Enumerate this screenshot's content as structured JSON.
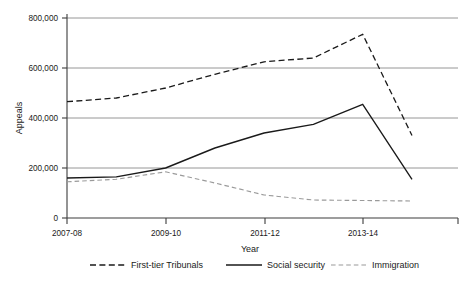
{
  "chart_data": {
    "type": "line",
    "title": "",
    "xlabel": "Year",
    "ylabel": "Appeals",
    "categories": [
      "2007-08",
      "2008-09",
      "2009-10",
      "2010-11",
      "2011-12",
      "2012-13",
      "2013-14",
      "2014-15"
    ],
    "xtick_labels": [
      "2007-08",
      "2009-10",
      "2011-12",
      "2013-14"
    ],
    "ytick_labels": [
      "0",
      "200,000",
      "400,000",
      "600,000",
      "800,000"
    ],
    "yticks": [
      0,
      200000,
      400000,
      600000,
      800000
    ],
    "ylim": [
      0,
      800000
    ],
    "grid": "horizontal",
    "legend_position": "bottom",
    "series": [
      {
        "name": "First-tier Tribunals",
        "style": "dashed",
        "color": "#1a1a1a",
        "values": [
          465000,
          480000,
          520000,
          575000,
          625000,
          640000,
          735000,
          330000
        ]
      },
      {
        "name": "Social security",
        "style": "solid",
        "color": "#1a1a1a",
        "values": [
          160000,
          165000,
          200000,
          280000,
          340000,
          375000,
          455000,
          155000
        ]
      },
      {
        "name": "Immigration",
        "style": "dashed-light",
        "color": "#9a9a9a",
        "values": [
          145000,
          155000,
          185000,
          140000,
          92000,
          72000,
          70000,
          68000
        ]
      }
    ]
  },
  "axis": {
    "y_title": "Appeals",
    "x_title": "Year",
    "y_labels": [
      "800,000",
      "600,000",
      "400,000",
      "200,000",
      "0"
    ],
    "x_labels": [
      "2007-08",
      "2009-10",
      "2011-12",
      "2013-14"
    ]
  },
  "legend": {
    "items": [
      {
        "label": "First-tier Tribunals"
      },
      {
        "label": "Social security"
      },
      {
        "label": "Immigration"
      }
    ]
  }
}
